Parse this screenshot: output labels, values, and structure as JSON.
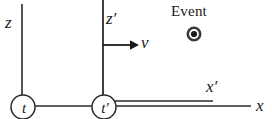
{
  "figure": {
    "type": "physics-reference-frame-diagram",
    "width": 272,
    "height": 119,
    "background_color": "#ffffff",
    "stroke_color": "#2b2b2b"
  },
  "labels": {
    "z_axis": "z",
    "z_prime_axis": "z′",
    "x_axis": "x",
    "x_prime_axis": "x′",
    "velocity": "v",
    "event": "Event",
    "clock_unprimed": "t",
    "clock_primed": "t′"
  },
  "elements": {
    "z_axis_line": {
      "name": "z-axis",
      "x": 22,
      "y_top": 4,
      "y_bottom": 98
    },
    "z_prime_axis_line": {
      "name": "z-prime-axis",
      "x": 103,
      "y_top": 0,
      "y_bottom": 96
    },
    "x_axis_line": {
      "name": "x-axis",
      "y": 106,
      "x_start": 31,
      "x_end": 250
    },
    "x_prime_axis_line": {
      "name": "x-prime-axis",
      "y": 101,
      "x_start": 114,
      "x_end": 213
    },
    "velocity_arrow": {
      "name": "velocity-arrow",
      "y": 45,
      "x_start": 103,
      "x_end": 136,
      "direction": "right"
    },
    "clock_unprimed_circle": {
      "name": "clock-t",
      "cx": 23,
      "cy": 107,
      "r": 12
    },
    "clock_primed_circle": {
      "name": "clock-t-prime",
      "cx": 104,
      "cy": 107,
      "r": 12
    },
    "event_marker": {
      "name": "event-marker",
      "cx": 194,
      "cy": 34,
      "r_outer": 6.5,
      "r_inner": 3.2
    }
  }
}
